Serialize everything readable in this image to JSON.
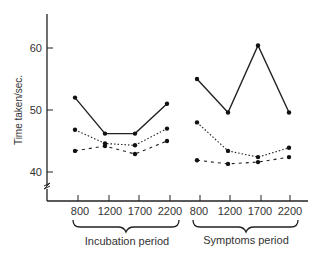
{
  "chart_data": {
    "type": "line",
    "title": "",
    "ylabel": "Time taken/sec.",
    "xlabel": "",
    "ylim": [
      38,
      66
    ],
    "yticks": [
      40,
      50,
      60
    ],
    "axis_break": true,
    "grid": false,
    "legend": null,
    "groups": [
      {
        "label": "Incubation period",
        "categories": [
          "800",
          "1200",
          "1700",
          "2200"
        ]
      },
      {
        "label": "Symptoms period",
        "categories": [
          "800",
          "1200",
          "1700",
          "2200"
        ]
      }
    ],
    "categories": [
      "800",
      "1200",
      "1700",
      "2200",
      "800",
      "1200",
      "1700",
      "2200"
    ],
    "series": [
      {
        "name": "solid",
        "style": "solid",
        "incubation": [
          52.0,
          46.2,
          46.2,
          51.0
        ],
        "symptoms": [
          55.0,
          49.6,
          60.4,
          49.6
        ]
      },
      {
        "name": "dotted",
        "style": "dotted",
        "incubation": [
          46.8,
          44.6,
          44.3,
          47.0
        ],
        "symptoms": [
          48.0,
          43.4,
          42.4,
          43.9
        ]
      },
      {
        "name": "dashed",
        "style": "dashed",
        "incubation": [
          43.4,
          44.2,
          42.9,
          45.0
        ],
        "symptoms": [
          41.9,
          41.3,
          41.6,
          42.4
        ]
      }
    ]
  },
  "labels": {
    "ylabel": "Time taken/sec.",
    "y60": "60",
    "y50": "50",
    "y40": "40",
    "incubation": "Incubation period",
    "symptoms": "Symptoms period",
    "x": [
      "800",
      "1200",
      "1700",
      "2200",
      "800",
      "1200",
      "1700",
      "2200"
    ]
  }
}
